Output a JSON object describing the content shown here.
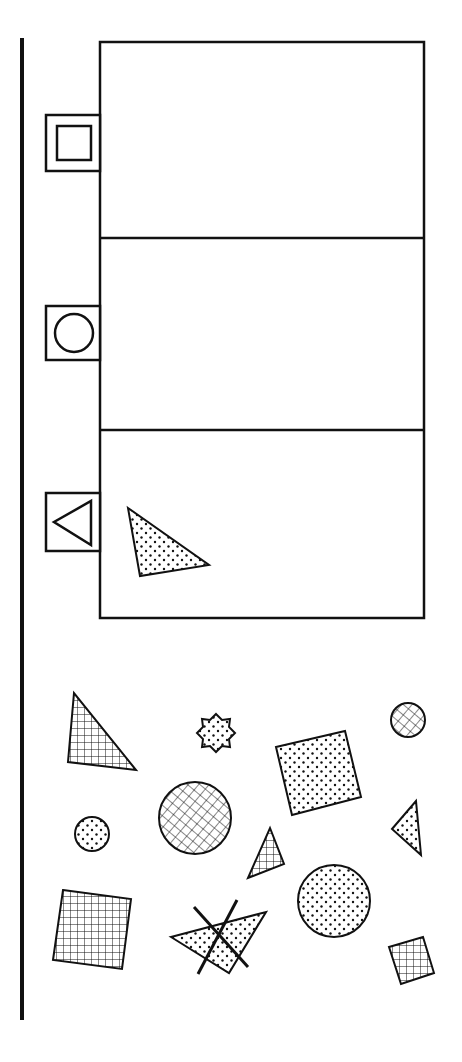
{
  "colors": {
    "ink": "#111111",
    "paper": "#ffffff"
  },
  "sort_bins": [
    {
      "label_icon": "square-icon",
      "category": "square",
      "contents": []
    },
    {
      "label_icon": "circle-icon",
      "category": "circle",
      "contents": []
    },
    {
      "label_icon": "triangle-icon",
      "category": "triangle",
      "contents": [
        "dotted-triangle"
      ]
    }
  ],
  "loose_shapes": [
    {
      "shape": "triangle",
      "fill": "grid"
    },
    {
      "shape": "star",
      "fill": "dotted"
    },
    {
      "shape": "circle",
      "fill": "grid"
    },
    {
      "shape": "square",
      "fill": "dotted"
    },
    {
      "shape": "circle",
      "fill": "grid"
    },
    {
      "shape": "circle",
      "fill": "dotted"
    },
    {
      "shape": "triangle",
      "fill": "grid"
    },
    {
      "shape": "triangle",
      "fill": "dotted"
    },
    {
      "shape": "circle",
      "fill": "dotted"
    },
    {
      "shape": "square",
      "fill": "grid"
    },
    {
      "shape": "triangle",
      "fill": "dotted",
      "crossed_out": true
    },
    {
      "shape": "square",
      "fill": "grid"
    }
  ]
}
